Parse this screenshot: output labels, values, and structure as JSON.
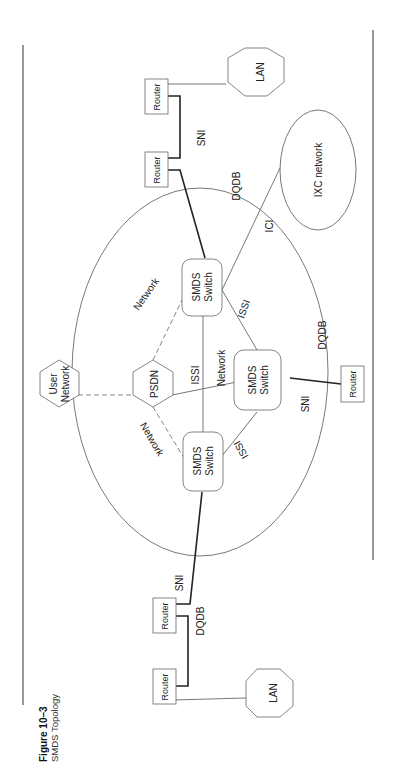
{
  "figure": {
    "number": "Figure 10–3",
    "title": "SMDS Topology",
    "orientation": "rotated 90° counter-clockwise"
  },
  "nodes": {
    "lan_top": {
      "label": "LAN"
    },
    "lan_bottom": {
      "label": "LAN"
    },
    "router_top_outer": {
      "label": "Router"
    },
    "router_top_inner": {
      "label": "Router"
    },
    "router_bottom_inner": {
      "label": "Router"
    },
    "router_bottom_outer": {
      "label": "Router"
    },
    "router_right": {
      "label": "Router"
    },
    "switch_top": {
      "line1": "SMDS",
      "line2": "Switch"
    },
    "switch_bottom": {
      "line1": "SMDS",
      "line2": "Switch"
    },
    "switch_right": {
      "line1": "SMDS",
      "line2": "Switch"
    },
    "psdn": {
      "label": "PSDN"
    },
    "user_network": {
      "line1": "User",
      "line2": "Network"
    },
    "ixc_network": {
      "label": "IXC network"
    }
  },
  "links": {
    "sni_top": "SNI",
    "sni_bottom": "SNI",
    "sni_right": "SNI",
    "dqdb_top": "DQDB",
    "dqdb_bottom": "DQDB",
    "dqdb_right": "DQDB",
    "ici": "ICI",
    "issi_middle": "ISSI",
    "issi_top_right": "ISSI",
    "issi_bottom_right": "ISSI",
    "network_top": "Network",
    "network_bottom": "Network",
    "network_middle": "Network"
  }
}
